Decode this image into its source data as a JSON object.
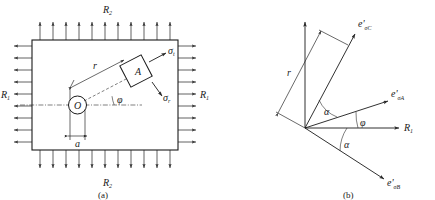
{
  "figure": {
    "type": "engineering-diagram",
    "background_color": "#ffffff",
    "line_color": "#1a1a1a",
    "arrow_color": "#3a3a3a"
  },
  "panel_a": {
    "caption": "(a)",
    "loads": {
      "horizontal_label": "R",
      "horizontal_subscript": "1",
      "vertical_label": "R",
      "vertical_subscript": "2",
      "top_label_full": "R2",
      "bottom_label_full": "R2",
      "left_label_full": "R1",
      "right_label_full": "R1",
      "top_arrow_count": 11,
      "bottom_arrow_count": 11,
      "left_arrow_count": 9,
      "right_arrow_count": 9,
      "top_direction": "up",
      "bottom_direction": "down",
      "left_direction": "left",
      "right_direction": "right"
    },
    "plate": {
      "shape": "rectangle",
      "fill": "#ffffff",
      "stroke": "#1a1a1a"
    },
    "hole": {
      "center_label": "O",
      "diameter_label": "a",
      "shape": "circle"
    },
    "radius": {
      "label": "r"
    },
    "angle": {
      "label": "φ"
    },
    "element": {
      "label": "A",
      "shape": "rotated-square",
      "stress_label_1": "σ",
      "stress_subscript_1": "t",
      "stress_label_2": "σ",
      "stress_subscript_2": "r",
      "stress_full_1": "σt",
      "stress_full_2": "σr"
    }
  },
  "panel_b": {
    "caption": "(b)",
    "axis_label": "R",
    "axis_subscript": "1",
    "axis_full": "R1",
    "radius_label": "r",
    "rays": [
      {
        "name": "ray-e-sigma-C",
        "label_base": "e'",
        "label_subscript": "σC",
        "label_full": "e'σC",
        "angle_deg": 62
      },
      {
        "name": "ray-e-sigma-A",
        "label_base": "e'",
        "label_subscript": "σA",
        "label_full": "e'σA",
        "angle_deg": 18
      },
      {
        "name": "ray-e-sigma-B",
        "label_base": "e'",
        "label_subscript": "σB",
        "label_full": "e'σB",
        "angle_deg": -33
      }
    ],
    "angles": [
      {
        "name": "angle-alpha-upper",
        "label": "α"
      },
      {
        "name": "angle-phi",
        "label": "φ"
      },
      {
        "name": "angle-alpha-lower",
        "label": "α"
      }
    ]
  }
}
